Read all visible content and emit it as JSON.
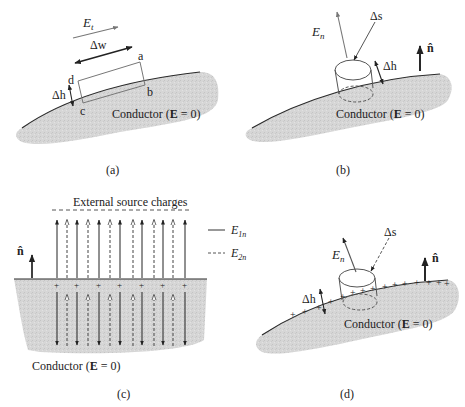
{
  "colors": {
    "conductor_fill": "#d9d9d9",
    "line": "#2a2a2a",
    "gray_line": "#7a7a7a",
    "background": "#ffffff"
  },
  "panels": {
    "a": {
      "caption": "(a)",
      "field_label": "E",
      "field_sub": "t",
      "width_label": "Δw",
      "height_label": "Δh",
      "corners": [
        "a",
        "b",
        "c",
        "d"
      ],
      "conductor_label": "Conductor (",
      "conductor_E": "E",
      "conductor_tail": " = 0)"
    },
    "b": {
      "caption": "(b)",
      "field_label": "E",
      "field_sub": "n",
      "area_label": "Δs",
      "height_label": "Δh",
      "normal_label": "n̂",
      "conductor_label": "Conductor (",
      "conductor_E": "E",
      "conductor_tail": " = 0)"
    },
    "c": {
      "caption": "(c)",
      "top_label": "External source charges",
      "normal_label": "n̂",
      "legend": [
        {
          "style": "solid",
          "label": "E",
          "sub": "1n"
        },
        {
          "style": "dashed",
          "label": "E",
          "sub": "2n"
        }
      ],
      "charge_symbol": "+",
      "charge_count": 7,
      "solid_arrow_count": 7,
      "dashed_arrow_count": 6,
      "conductor_label": "Conductor (",
      "conductor_E": "E",
      "conductor_tail": " = 0)"
    },
    "d": {
      "caption": "(d)",
      "field_label": "E",
      "field_sub": "n",
      "area_label": "Δs",
      "height_label": "Δh",
      "normal_label": "n̂",
      "charge_symbol": "+",
      "conductor_label": "Conductor (",
      "conductor_E": "E",
      "conductor_tail": " = 0)"
    }
  }
}
